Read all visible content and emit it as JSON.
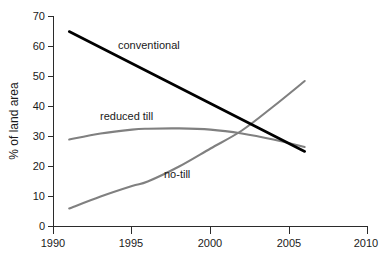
{
  "chart_data": {
    "type": "line",
    "title": "",
    "xlabel": "",
    "ylabel": "% of land area",
    "xlim": [
      1990,
      2010
    ],
    "ylim": [
      0,
      70
    ],
    "grid": false,
    "legend_position": "inline-labels",
    "x_ticks": [
      "1990",
      "1995",
      "2000",
      "2005",
      "2010"
    ],
    "y_ticks": [
      "0",
      "10",
      "20",
      "30",
      "40",
      "50",
      "60",
      "70"
    ],
    "series": [
      {
        "name": "conventional",
        "color": "#000000",
        "x": [
          1991,
          1994,
          1997,
          2000,
          2003,
          2006
        ],
        "values": [
          65,
          57,
          49,
          41,
          33,
          25
        ]
      },
      {
        "name": "reduced till",
        "color": "#808080",
        "x": [
          1991,
          1993,
          1995,
          1996,
          1998,
          2000,
          2002,
          2004,
          2006
        ],
        "values": [
          29,
          31,
          32.3,
          32.6,
          32.7,
          32.3,
          31,
          29,
          26.5
        ]
      },
      {
        "name": "no-till",
        "color": "#808080",
        "x": [
          1991,
          1993,
          1995,
          1996,
          1998,
          2000,
          2002,
          2004,
          2006
        ],
        "values": [
          6,
          10,
          13.5,
          15,
          20,
          26,
          32,
          40,
          48.5
        ]
      }
    ],
    "annotations": [
      {
        "text": "conventional",
        "x": 2000.5,
        "y": 57
      },
      {
        "text": "reduced till",
        "x": 1995.2,
        "y": 37.5
      },
      {
        "text": "no-till",
        "x": 1999.5,
        "y": 19.5
      }
    ]
  },
  "axis": {
    "y_title": "% of land area"
  }
}
